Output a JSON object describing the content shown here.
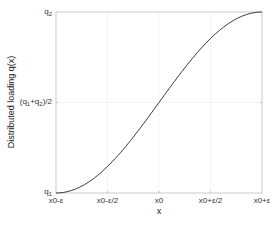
{
  "chart_data": {
    "type": "line",
    "title": "",
    "xlabel": "x",
    "ylabel": "Distributed loading q(x)",
    "x_ticks": [
      "x0-ε",
      "x0-ε/2",
      "x0",
      "x0+ε/2",
      "x0+ε"
    ],
    "y_ticks": [
      "q1",
      "(q1+q2)/2",
      "q2"
    ],
    "xlim": [
      -1,
      1
    ],
    "ylim": [
      0,
      1
    ],
    "grid": true,
    "legend": null,
    "series": [
      {
        "name": "q(x)",
        "x": [
          -1,
          -0.75,
          -0.5,
          -0.25,
          0,
          0.25,
          0.5,
          0.75,
          1
        ],
        "y": [
          0,
          0.038,
          0.146,
          0.309,
          0.5,
          0.691,
          0.854,
          0.962,
          1
        ],
        "color": "#222222"
      }
    ]
  },
  "axes": {
    "xlabel": "x",
    "ylabel": "Distributed loading q(x)",
    "xticks": [
      {
        "main": "x0-ε"
      },
      {
        "main": "x0-ε/2"
      },
      {
        "main": "x0"
      },
      {
        "main": "x0+ε/2"
      },
      {
        "main": "x0+ε"
      }
    ],
    "yticks": {
      "q1_base": "q",
      "q1_sub": "1",
      "mid_open": "(q",
      "mid_sub1": "1",
      "mid_plus": "+q",
      "mid_sub2": "2",
      "mid_close": ")/2",
      "q2_base": "q",
      "q2_sub": "2"
    }
  }
}
